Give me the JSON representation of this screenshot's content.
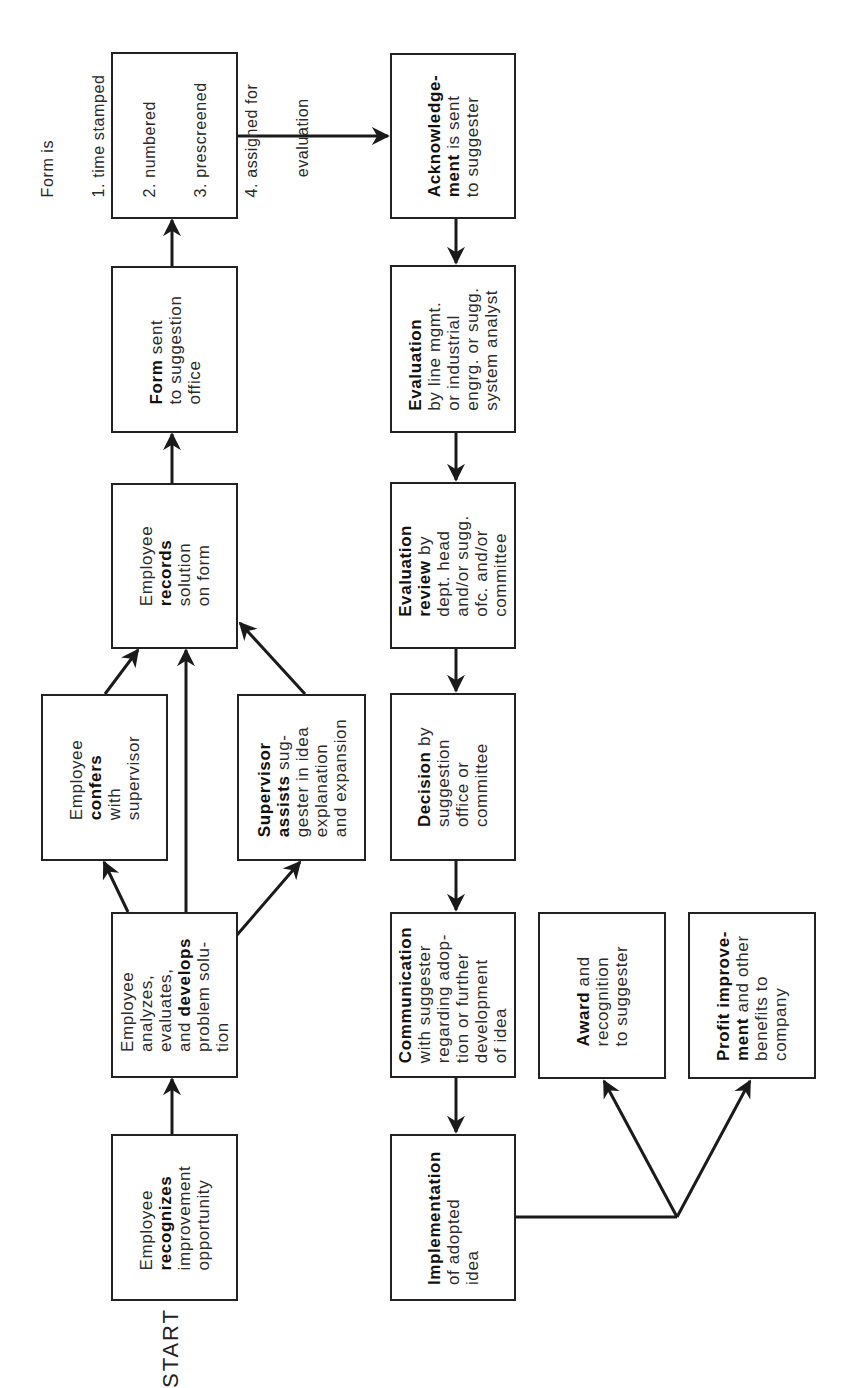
{
  "diagram": {
    "start_label": "START",
    "nodes": {
      "recognizes": {
        "lines": [
          [
            "",
            "Employee"
          ],
          [
            "recognizes",
            ""
          ],
          [
            "",
            "improvement"
          ],
          [
            "",
            "opportunity"
          ]
        ]
      },
      "analyzes": {
        "lines": [
          [
            "",
            "Employee"
          ],
          [
            "",
            "analyzes,"
          ],
          [
            "",
            "evaluates,"
          ],
          [
            "",
            "and "
          ],
          [
            "",
            "problem solu-"
          ],
          [
            "",
            "tion"
          ]
        ],
        "bold_word": "develops"
      },
      "confers": {
        "lines": [
          [
            "",
            "Employee"
          ],
          [
            "confers",
            ""
          ],
          [
            "",
            "with"
          ],
          [
            "",
            "supervisor"
          ]
        ]
      },
      "supervisor_assists": {
        "lines": [
          [
            "Supervisor",
            ""
          ],
          [
            "assists",
            " sug-"
          ],
          [
            "",
            "gester in idea"
          ],
          [
            "",
            "explanation"
          ],
          [
            "",
            "and expansion"
          ]
        ]
      },
      "records": {
        "lines": [
          [
            "",
            "Employee"
          ],
          [
            "records",
            ""
          ],
          [
            "",
            "solution"
          ],
          [
            "",
            "on form"
          ]
        ]
      },
      "form_sent": {
        "lines": [
          [
            "Form",
            " sent"
          ],
          [
            "",
            "to suggestion"
          ],
          [
            "",
            "office"
          ]
        ]
      },
      "form_is": {
        "lines": [
          [
            "",
            "Form is"
          ],
          [
            "",
            "1. time stamped"
          ],
          [
            "",
            "2. numbered"
          ],
          [
            "",
            "3. prescreened"
          ],
          [
            "",
            "4. assigned for"
          ],
          [
            "",
            "    evaluation"
          ]
        ]
      },
      "acknowledgement": {
        "lines": [
          [
            "Acknowledge-",
            ""
          ],
          [
            "ment",
            " is sent"
          ],
          [
            "",
            "to suggester"
          ]
        ]
      },
      "evaluation": {
        "lines": [
          [
            "Evaluation",
            ""
          ],
          [
            "",
            "by line mgmt."
          ],
          [
            "",
            "or industrial"
          ],
          [
            "",
            "engrg. or sugg."
          ],
          [
            "",
            "system analyst"
          ]
        ]
      },
      "evaluation_review": {
        "lines": [
          [
            "Evaluation",
            ""
          ],
          [
            "review",
            " by"
          ],
          [
            "",
            "dept. head"
          ],
          [
            "",
            "and/or sugg."
          ],
          [
            "",
            "ofc. and/or"
          ],
          [
            "",
            "committee"
          ]
        ]
      },
      "decision": {
        "lines": [
          [
            "Decision",
            " by"
          ],
          [
            "",
            "suggestion"
          ],
          [
            "",
            "office or"
          ],
          [
            "",
            "committee"
          ]
        ]
      },
      "communication": {
        "lines": [
          [
            "Communication",
            ""
          ],
          [
            "",
            "with suggester"
          ],
          [
            "",
            "regarding adop-"
          ],
          [
            "",
            "tion or further"
          ],
          [
            "",
            "development"
          ],
          [
            "",
            "of idea"
          ]
        ]
      },
      "implementation": {
        "lines": [
          [
            "Implementation",
            ""
          ],
          [
            "",
            "of adopted"
          ],
          [
            "",
            "idea"
          ]
        ]
      },
      "award": {
        "lines": [
          [
            "Award",
            " and"
          ],
          [
            "",
            "recognition"
          ],
          [
            "",
            "to suggester"
          ]
        ]
      },
      "profit": {
        "lines": [
          [
            "Profit improve-",
            ""
          ],
          [
            "ment",
            " and other"
          ],
          [
            "",
            "benefits to"
          ],
          [
            "",
            "company"
          ]
        ]
      }
    },
    "edges": [
      {
        "from": "recognizes",
        "to": "analyzes"
      },
      {
        "from": "analyzes",
        "to": "confers"
      },
      {
        "from": "analyzes",
        "to": "records"
      },
      {
        "from": "analyzes",
        "to": "supervisor_assists"
      },
      {
        "from": "confers",
        "to": "records"
      },
      {
        "from": "supervisor_assists",
        "to": "records"
      },
      {
        "from": "records",
        "to": "form_sent"
      },
      {
        "from": "form_sent",
        "to": "form_is"
      },
      {
        "from": "form_is",
        "to": "acknowledgement"
      },
      {
        "from": "acknowledgement",
        "to": "evaluation"
      },
      {
        "from": "evaluation",
        "to": "evaluation_review"
      },
      {
        "from": "evaluation_review",
        "to": "decision"
      },
      {
        "from": "decision",
        "to": "communication"
      },
      {
        "from": "communication",
        "to": "implementation"
      },
      {
        "from": "implementation",
        "to": "award"
      },
      {
        "from": "implementation",
        "to": "profit"
      }
    ],
    "colors": {
      "stroke": "#222222",
      "background": "#ffffff",
      "text": "#2a2a2a"
    }
  }
}
